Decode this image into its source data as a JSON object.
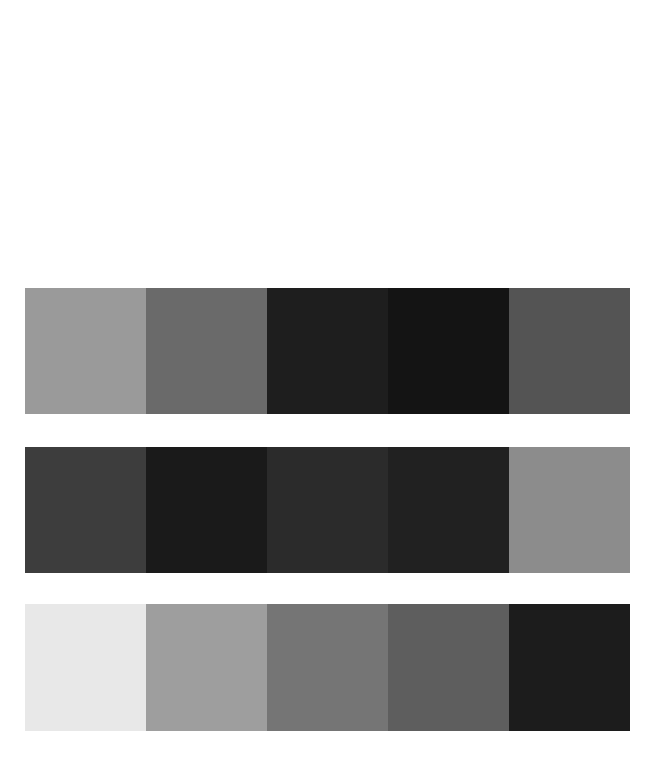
{
  "page": {
    "background_color": "#ffffff",
    "width": 655,
    "height": 757
  },
  "chart_data": {
    "type": "heatmap",
    "title": "",
    "subtitle": "",
    "xlabel": "",
    "ylabel": "",
    "grid": false,
    "legend_position": "none",
    "rows": 3,
    "columns": 5,
    "categories": [
      "1",
      "2",
      "3",
      "4",
      "5"
    ],
    "row_labels": [
      "Band 1",
      "Band 2",
      "Band 3"
    ],
    "colorscale": "grayscale",
    "series": [
      {
        "name": "Band 1",
        "values": [
          154,
          106,
          30,
          20,
          84
        ],
        "colors": [
          "#9a9a9a",
          "#6a6a6a",
          "#1e1e1e",
          "#141414",
          "#545454"
        ]
      },
      {
        "name": "Band 2",
        "values": [
          61,
          26,
          43,
          33,
          140
        ],
        "colors": [
          "#3d3d3d",
          "#1a1a1a",
          "#2b2b2b",
          "#212121",
          "#8c8c8c"
        ]
      },
      {
        "name": "Band 3",
        "values": [
          232,
          158,
          117,
          94,
          28
        ],
        "colors": [
          "#e8e8e8",
          "#9e9e9e",
          "#757575",
          "#5e5e5e",
          "#1c1c1c"
        ]
      }
    ]
  },
  "swatch_grid": {
    "rows": [
      {
        "name": "band-1",
        "cells": [
          {
            "color": "#9a9a9a",
            "label": ""
          },
          {
            "color": "#6a6a6a",
            "label": ""
          },
          {
            "color": "#1e1e1e",
            "label": ""
          },
          {
            "color": "#141414",
            "label": ""
          },
          {
            "color": "#545454",
            "label": ""
          }
        ]
      },
      {
        "name": "band-2",
        "cells": [
          {
            "color": "#3d3d3d",
            "label": ""
          },
          {
            "color": "#1a1a1a",
            "label": ""
          },
          {
            "color": "#2b2b2b",
            "label": ""
          },
          {
            "color": "#212121",
            "label": ""
          },
          {
            "color": "#8c8c8c",
            "label": ""
          }
        ]
      },
      {
        "name": "band-3",
        "cells": [
          {
            "color": "#e8e8e8",
            "label": ""
          },
          {
            "color": "#9e9e9e",
            "label": ""
          },
          {
            "color": "#757575",
            "label": ""
          },
          {
            "color": "#5e5e5e",
            "label": ""
          },
          {
            "color": "#1c1c1c",
            "label": ""
          }
        ]
      }
    ]
  }
}
